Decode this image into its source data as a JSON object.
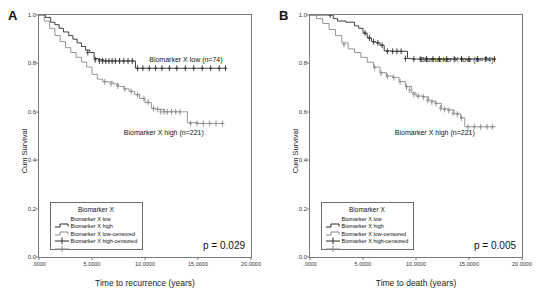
{
  "figure": {
    "panels": [
      {
        "letter": "A",
        "ylabel": "Cum Survival",
        "xlabel": "Time to recurrence (years)",
        "pvalue": "p = 0.029",
        "annotation_low": "Biomarker X low (n=74)",
        "annotation_high": "Biomarker X high (n=221)",
        "yticks": [
          "0.0",
          "0.2",
          "0.4",
          "0.6",
          "0.8",
          "1.0"
        ],
        "xticks": [
          ".0000",
          "5.0000",
          "10.0000",
          "15.0000",
          "20.0000"
        ],
        "legend": {
          "title": "Biomarker X",
          "items": [
            {
              "label": "Biomarker X low",
              "symbol": "step-line"
            },
            {
              "label": "Biomarker X high",
              "symbol": "step-line"
            },
            {
              "label": "Biomarker X low-censored",
              "symbol": "plus-mark"
            },
            {
              "label": "Biomarker X high-censored",
              "symbol": "plus-mark"
            }
          ]
        }
      },
      {
        "letter": "B",
        "ylabel": "Cum Survival",
        "xlabel": "Time to death (years)",
        "pvalue": "p = 0.005",
        "annotation_low": "Biomarker X low (n=74)",
        "annotation_high": "Biomarker X high (n=221)",
        "yticks": [
          "0.0",
          "0.2",
          "0.4",
          "0.6",
          "0.8",
          "1.0"
        ],
        "xticks": [
          ".0000",
          "5.0000",
          "10.0000",
          "15.0000",
          "20.0000"
        ],
        "legend": {
          "title": "Biomarker X",
          "items": [
            {
              "label": "Biomarker X low",
              "symbol": "step-line"
            },
            {
              "label": "Biomarker X high",
              "symbol": "step-line"
            },
            {
              "label": "Biomarker X low-censored",
              "symbol": "plus-mark"
            },
            {
              "label": "Biomarker X high-censored",
              "symbol": "plus-mark"
            }
          ]
        }
      }
    ]
  },
  "colors": {
    "low_curve": "#2b2b2b",
    "high_curve": "#8a8a8a",
    "frame": "#7a7a7a",
    "text": "#111111"
  },
  "chart_data": [
    {
      "type": "line",
      "subtype": "kaplan-meier-step",
      "panel": "A",
      "title": "",
      "xlabel": "Time to recurrence (years)",
      "ylabel": "Cum Survival",
      "xlim": [
        0,
        20
      ],
      "ylim": [
        0,
        1.0
      ],
      "xticks": [
        0,
        5,
        10,
        15,
        20
      ],
      "yticks": [
        0.0,
        0.2,
        0.4,
        0.6,
        0.8,
        1.0
      ],
      "grid": false,
      "legend_position": "bottom-left",
      "annotations": [
        {
          "text": "Biomarker X low (n=74)",
          "x": 12.0,
          "y": 0.85
        },
        {
          "text": "Biomarker X high (n=221)",
          "x": 11.0,
          "y": 0.47
        },
        {
          "text": "p = 0.029",
          "x": 17.0,
          "y": 0.05
        }
      ],
      "series": [
        {
          "name": "Biomarker X low",
          "n": 74,
          "color": "#2b2b2b",
          "x": [
            0.0,
            0.6,
            1.1,
            1.5,
            1.9,
            2.3,
            2.8,
            3.2,
            3.6,
            4.0,
            4.4,
            4.8,
            5.2,
            5.6,
            6.1,
            7.0,
            8.0,
            9.1,
            10.0,
            12.0,
            14.0,
            16.0,
            17.6
          ],
          "y": [
            1.0,
            0.99,
            0.97,
            0.96,
            0.945,
            0.93,
            0.915,
            0.9,
            0.885,
            0.87,
            0.855,
            0.845,
            0.82,
            0.815,
            0.81,
            0.81,
            0.81,
            0.78,
            0.78,
            0.78,
            0.78,
            0.78,
            0.78
          ],
          "censored_x": [
            4.6,
            5.3,
            5.7,
            6.0,
            6.3,
            6.6,
            6.9,
            7.2,
            7.6,
            8.0,
            8.4,
            8.8,
            9.3,
            9.8,
            10.4,
            11.0,
            11.6,
            12.3,
            13.0,
            13.8,
            14.6,
            15.4,
            16.2,
            17.0,
            17.6
          ],
          "censored_y": [
            0.845,
            0.815,
            0.81,
            0.81,
            0.81,
            0.81,
            0.81,
            0.81,
            0.81,
            0.81,
            0.81,
            0.81,
            0.78,
            0.78,
            0.78,
            0.78,
            0.78,
            0.78,
            0.78,
            0.78,
            0.78,
            0.78,
            0.78,
            0.78,
            0.78
          ]
        },
        {
          "name": "Biomarker X high",
          "n": 221,
          "color": "#8a8a8a",
          "x": [
            0.0,
            0.5,
            1.0,
            1.5,
            2.0,
            2.5,
            3.0,
            3.5,
            4.0,
            4.5,
            5.0,
            5.5,
            6.0,
            6.5,
            7.0,
            7.5,
            8.0,
            8.5,
            9.0,
            9.5,
            10.0,
            10.6,
            11.0,
            11.8,
            12.6,
            13.4,
            14.0,
            15.0,
            16.0,
            17.5
          ],
          "y": [
            1.0,
            0.975,
            0.945,
            0.915,
            0.89,
            0.865,
            0.845,
            0.825,
            0.805,
            0.785,
            0.755,
            0.735,
            0.725,
            0.723,
            0.715,
            0.705,
            0.695,
            0.685,
            0.672,
            0.655,
            0.638,
            0.615,
            0.61,
            0.6,
            0.6,
            0.6,
            0.555,
            0.552,
            0.552,
            0.552
          ],
          "censored_x": [
            6.2,
            6.8,
            7.4,
            8.1,
            8.7,
            9.3,
            9.9,
            10.3,
            10.8,
            11.2,
            11.5,
            11.8,
            12.1,
            12.5,
            12.9,
            13.3,
            14.3,
            14.9,
            15.5,
            16.1,
            16.7,
            17.3
          ],
          "censored_y": [
            0.724,
            0.716,
            0.707,
            0.694,
            0.684,
            0.67,
            0.655,
            0.64,
            0.613,
            0.61,
            0.6,
            0.6,
            0.6,
            0.6,
            0.6,
            0.6,
            0.552,
            0.552,
            0.552,
            0.552,
            0.552,
            0.552
          ]
        }
      ]
    },
    {
      "type": "line",
      "subtype": "kaplan-meier-step",
      "panel": "B",
      "title": "",
      "xlabel": "Time to death (years)",
      "ylabel": "Cum Survival",
      "xlim": [
        0,
        20
      ],
      "ylim": [
        0,
        1.0
      ],
      "xticks": [
        0,
        5,
        10,
        15,
        20
      ],
      "yticks": [
        0.0,
        0.2,
        0.4,
        0.6,
        0.8,
        1.0
      ],
      "grid": false,
      "legend_position": "bottom-left",
      "annotations": [
        {
          "text": "Biomarker X low (n=74)",
          "x": 12.0,
          "y": 0.88
        },
        {
          "text": "Biomarker X high (n=221)",
          "x": 11.0,
          "y": 0.46
        },
        {
          "text": "p = 0.005",
          "x": 17.0,
          "y": 0.05
        }
      ],
      "series": [
        {
          "name": "Biomarker X low",
          "n": 74,
          "color": "#2b2b2b",
          "x": [
            0.0,
            1.8,
            2.2,
            2.6,
            3.4,
            4.2,
            4.6,
            5.0,
            5.4,
            5.8,
            6.2,
            6.6,
            7.0,
            7.6,
            8.4,
            9.2,
            9.6,
            11.0,
            13.0,
            15.0,
            17.5
          ],
          "y": [
            1.0,
            1.0,
            0.985,
            0.975,
            0.97,
            0.955,
            0.945,
            0.925,
            0.905,
            0.89,
            0.885,
            0.875,
            0.852,
            0.85,
            0.85,
            0.82,
            0.818,
            0.818,
            0.818,
            0.818,
            0.818
          ],
          "censored_x": [
            1.9,
            5.2,
            5.6,
            6.0,
            6.4,
            6.8,
            7.3,
            7.8,
            8.2,
            8.6,
            9.0,
            9.8,
            10.4,
            11.0,
            11.6,
            12.2,
            12.9,
            13.6,
            14.3,
            15.0,
            15.8,
            16.6,
            17.4
          ],
          "censored_y": [
            1.0,
            0.925,
            0.905,
            0.89,
            0.885,
            0.875,
            0.85,
            0.85,
            0.85,
            0.85,
            0.82,
            0.818,
            0.818,
            0.818,
            0.818,
            0.818,
            0.818,
            0.818,
            0.818,
            0.818,
            0.818,
            0.818,
            0.818
          ]
        },
        {
          "name": "Biomarker X high",
          "n": 221,
          "color": "#8a8a8a",
          "x": [
            0.0,
            0.6,
            1.2,
            1.8,
            2.4,
            3.0,
            3.6,
            4.2,
            4.8,
            5.4,
            6.0,
            6.6,
            7.2,
            7.8,
            8.4,
            9.0,
            9.6,
            10.0,
            10.6,
            11.2,
            11.8,
            12.4,
            13.0,
            13.6,
            14.2,
            14.6,
            15.4,
            16.4,
            17.5
          ],
          "y": [
            1.0,
            0.985,
            0.965,
            0.94,
            0.915,
            0.885,
            0.86,
            0.845,
            0.825,
            0.805,
            0.785,
            0.762,
            0.748,
            0.742,
            0.725,
            0.705,
            0.678,
            0.665,
            0.662,
            0.645,
            0.635,
            0.612,
            0.608,
            0.592,
            0.575,
            0.538,
            0.538,
            0.538,
            0.538
          ],
          "censored_x": [
            3.2,
            6.1,
            6.7,
            7.3,
            7.9,
            8.5,
            9.1,
            9.4,
            9.8,
            10.2,
            10.7,
            11.1,
            11.5,
            11.9,
            12.3,
            12.7,
            13.1,
            13.5,
            13.9,
            14.3,
            14.9,
            15.5,
            16.1,
            16.7,
            17.2
          ],
          "censored_y": [
            0.878,
            0.783,
            0.76,
            0.747,
            0.742,
            0.724,
            0.703,
            0.69,
            0.672,
            0.665,
            0.662,
            0.648,
            0.64,
            0.634,
            0.615,
            0.61,
            0.606,
            0.594,
            0.59,
            0.574,
            0.538,
            0.538,
            0.538,
            0.538,
            0.538
          ]
        }
      ]
    }
  ]
}
